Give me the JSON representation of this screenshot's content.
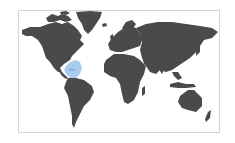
{
  "map": {
    "title": "World map",
    "projection": "equirectangular",
    "land_color": "#4a4a4a",
    "background_color": "#ffffff",
    "border_color": "#d4d4d4",
    "highlight": {
      "region": "Caribbean",
      "color": "#a9cdf0"
    },
    "regions": [
      {
        "name": "North America",
        "highlighted": false
      },
      {
        "name": "Greenland",
        "highlighted": false
      },
      {
        "name": "Caribbean",
        "highlighted": true
      },
      {
        "name": "South America",
        "highlighted": false
      },
      {
        "name": "Europe",
        "highlighted": false
      },
      {
        "name": "Africa",
        "highlighted": false
      },
      {
        "name": "Asia",
        "highlighted": false
      },
      {
        "name": "Oceania",
        "highlighted": false
      }
    ]
  }
}
